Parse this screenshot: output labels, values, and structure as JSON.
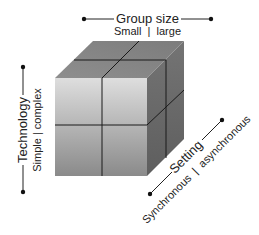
{
  "diagram": {
    "type": "3d-cube",
    "colors": {
      "front_top": "#dcdcdc",
      "front_bottom": "#8c8c8c",
      "top_face": "#8a8a8a",
      "right_face": "#6b6b6b",
      "grid_lines": "#1a1a1a",
      "axis_lines": "#222222"
    }
  },
  "axes": {
    "group_size": {
      "title": "Group size",
      "range_label": "Small  |  large",
      "low": "Small",
      "high": "large"
    },
    "technology": {
      "title": "Technology",
      "range_label": "Simple | complex",
      "low": "Simple",
      "high": "complex"
    },
    "setting": {
      "title": "Setting",
      "range_label": "Synchronous  |  asynchronous",
      "low": "Synchronous",
      "high": "asynchronous"
    }
  }
}
